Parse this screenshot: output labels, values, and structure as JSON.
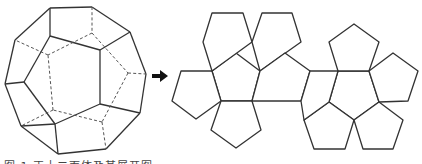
{
  "figure": {
    "line_color": "#333333",
    "hidden_line_color": "#555555",
    "arrow_color": "#111111"
  },
  "dodecahedron": {
    "solid_edges": [
      [
        [
          50,
          8
        ],
        [
          92,
          7
        ]
      ],
      [
        [
          92,
          7
        ],
        [
          130,
          32
        ]
      ],
      [
        [
          130,
          32
        ],
        [
          146,
          74
        ]
      ],
      [
        [
          146,
          74
        ],
        [
          140,
          113
        ]
      ],
      [
        [
          140,
          113
        ],
        [
          106,
          149
        ]
      ],
      [
        [
          106,
          149
        ],
        [
          58,
          154
        ]
      ],
      [
        [
          58,
          154
        ],
        [
          21,
          126
        ]
      ],
      [
        [
          21,
          126
        ],
        [
          5,
          84
        ]
      ],
      [
        [
          5,
          84
        ],
        [
          15,
          40
        ]
      ],
      [
        [
          15,
          40
        ],
        [
          50,
          8
        ]
      ],
      [
        [
          50,
          8
        ],
        [
          50,
          36
        ]
      ],
      [
        [
          50,
          36
        ],
        [
          100,
          50
        ]
      ],
      [
        [
          100,
          50
        ],
        [
          130,
          32
        ]
      ],
      [
        [
          100,
          50
        ],
        [
          100,
          104
        ]
      ],
      [
        [
          100,
          104
        ],
        [
          140,
          113
        ]
      ],
      [
        [
          100,
          104
        ],
        [
          55,
          124
        ]
      ],
      [
        [
          55,
          124
        ],
        [
          58,
          154
        ]
      ],
      [
        [
          55,
          124
        ],
        [
          21,
          126
        ]
      ],
      [
        [
          24,
          82
        ],
        [
          5,
          84
        ]
      ],
      [
        [
          24,
          82
        ],
        [
          50,
          36
        ]
      ],
      [
        [
          24,
          82
        ],
        [
          55,
          124
        ]
      ]
    ],
    "hidden_edges": [
      [
        [
          92,
          7
        ],
        [
          92,
          33
        ]
      ],
      [
        [
          92,
          33
        ],
        [
          48,
          55
        ]
      ],
      [
        [
          92,
          33
        ],
        [
          128,
          73
        ]
      ],
      [
        [
          128,
          73
        ],
        [
          146,
          74
        ]
      ],
      [
        [
          128,
          73
        ],
        [
          102,
          122
        ]
      ],
      [
        [
          102,
          122
        ],
        [
          106,
          149
        ]
      ],
      [
        [
          102,
          122
        ],
        [
          53,
          110
        ]
      ],
      [
        [
          53,
          110
        ],
        [
          21,
          126
        ]
      ],
      [
        [
          53,
          110
        ],
        [
          48,
          55
        ]
      ],
      [
        [
          48,
          55
        ],
        [
          15,
          40
        ]
      ]
    ]
  },
  "arrow": {
    "label": "→",
    "x": 153,
    "y": 75
  },
  "net": {
    "faces": [
      [
        [
          236,
          53
        ],
        [
          260,
          71
        ],
        [
          252,
          101
        ],
        [
          221,
          101
        ],
        [
          212,
          71
        ]
      ],
      [
        [
          212,
          71
        ],
        [
          221,
          101
        ],
        [
          196,
          119
        ],
        [
          172,
          101
        ],
        [
          181,
          71
        ]
      ],
      [
        [
          212,
          71
        ],
        [
          203,
          42
        ],
        [
          212,
          13
        ],
        [
          243,
          13
        ],
        [
          252,
          42
        ]
      ],
      [
        [
          260,
          71
        ],
        [
          252,
          42
        ],
        [
          262,
          13
        ],
        [
          292,
          13
        ],
        [
          301,
          42
        ]
      ],
      [
        [
          221,
          101
        ],
        [
          252,
          101
        ],
        [
          261,
          130
        ],
        [
          236,
          148
        ],
        [
          211,
          130
        ]
      ],
      [
        [
          252,
          101
        ],
        [
          260,
          71
        ],
        [
          285,
          53
        ],
        [
          310,
          71
        ],
        [
          301,
          101
        ]
      ],
      [
        [
          338,
          71
        ],
        [
          369,
          71
        ],
        [
          379,
          102
        ],
        [
          354,
          120
        ],
        [
          329,
          102
        ]
      ],
      [
        [
          338,
          71
        ],
        [
          329,
          42
        ],
        [
          354,
          24
        ],
        [
          379,
          42
        ],
        [
          369,
          71
        ]
      ],
      [
        [
          369,
          71
        ],
        [
          393,
          53
        ],
        [
          418,
          71
        ],
        [
          408,
          101
        ],
        [
          379,
          102
        ]
      ],
      [
        [
          329,
          102
        ],
        [
          354,
          120
        ],
        [
          345,
          149
        ],
        [
          314,
          149
        ],
        [
          304,
          120
        ]
      ],
      [
        [
          354,
          120
        ],
        [
          379,
          102
        ],
        [
          403,
          120
        ],
        [
          393,
          149
        ],
        [
          363,
          149
        ]
      ],
      [
        [
          301,
          101
        ],
        [
          310,
          71
        ],
        [
          338,
          71
        ],
        [
          329,
          102
        ],
        [
          304,
          120
        ]
      ]
    ]
  },
  "caption": {
    "text": "图 1  正十二面体及其展开图",
    "note": "caption partially cropped at bottom edge"
  }
}
